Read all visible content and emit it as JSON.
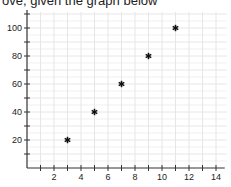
{
  "caption": "ove, given the graph below",
  "chart_data": {
    "type": "scatter",
    "title": "",
    "xlabel": "",
    "ylabel": "",
    "x": [
      3,
      5,
      7,
      9,
      11
    ],
    "y": [
      20,
      40,
      60,
      80,
      100
    ],
    "marker": "asterisk",
    "xlim": [
      0,
      14.5
    ],
    "ylim": [
      0,
      110
    ],
    "x_ticks_labeled": [
      2,
      4,
      6,
      8,
      10,
      12,
      14
    ],
    "x_minor_step": 1,
    "y_ticks_labeled": [
      20,
      40,
      60,
      80,
      100
    ],
    "y_minor_step": 10,
    "grid": true,
    "legend": null
  },
  "colors": {
    "grid": "#e6e6e6",
    "axis": "#333333",
    "marker": "#111111",
    "text": "#222222"
  }
}
